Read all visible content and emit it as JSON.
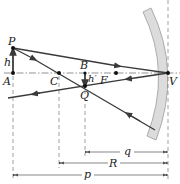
{
  "diagram": {
    "points": {
      "P": {
        "label": "P",
        "x": 13,
        "y": 48
      },
      "A": {
        "label": "A",
        "x": 13,
        "y": 73
      },
      "C": {
        "label": "C",
        "x": 59,
        "y": 73
      },
      "B": {
        "label": "B",
        "x": 85,
        "y": 73
      },
      "Q": {
        "label": "Q",
        "x": 85,
        "y": 86
      },
      "F": {
        "label": "F",
        "x": 116,
        "y": 73
      },
      "V": {
        "label": "V",
        "x": 168,
        "y": 73
      }
    },
    "heights": {
      "object": "h",
      "image": "h′"
    },
    "dimensions": {
      "q": "q",
      "R": "R",
      "p": "p"
    },
    "colors": {
      "ray": "#3a3a3a",
      "axis": "#555555",
      "mirror_fill": "#d9d9d9",
      "mirror_stroke": "#9a9a9a",
      "text": "#222222"
    }
  }
}
